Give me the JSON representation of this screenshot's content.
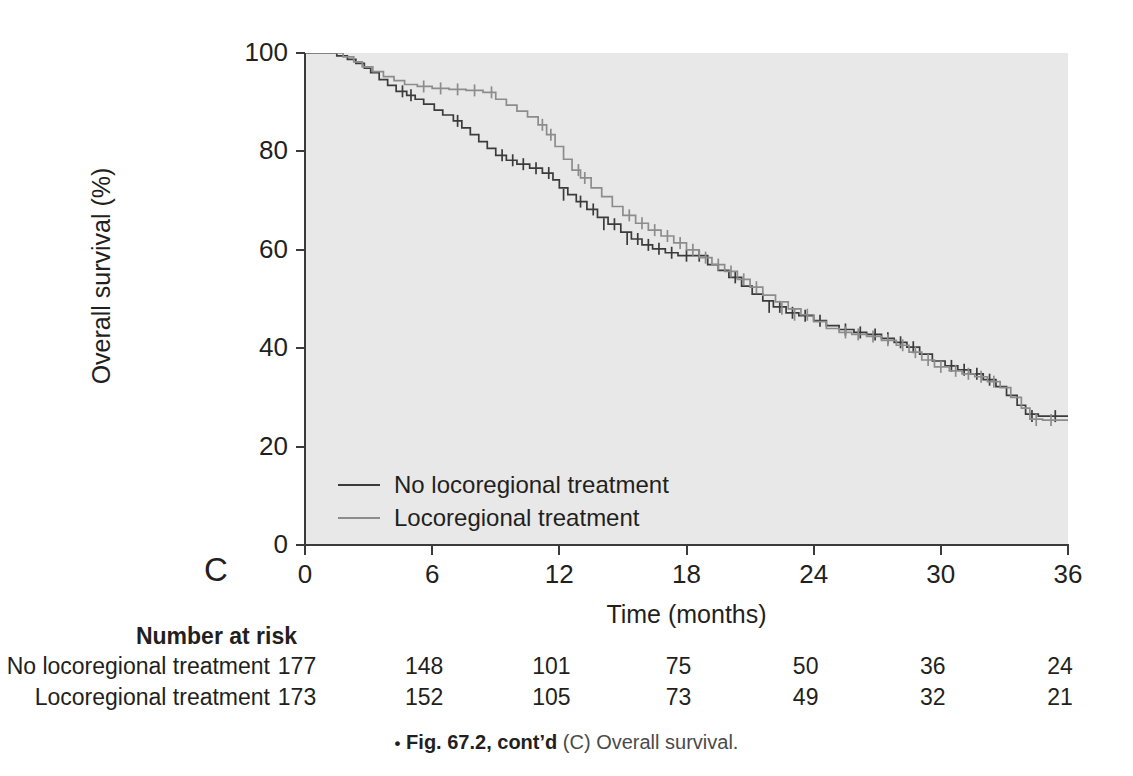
{
  "panel": {
    "letter": "C"
  },
  "axes": {
    "y_title": "Overall survival (%)",
    "x_title": "Time (months)",
    "y_ticks": [
      "100",
      "80",
      "60",
      "40",
      "20",
      "0"
    ],
    "x_ticks": [
      "0",
      "6",
      "12",
      "18",
      "24",
      "30",
      "36"
    ]
  },
  "legend": {
    "items": [
      {
        "label": "No locoregional treatment",
        "color": "#3b3b3b"
      },
      {
        "label": "Locoregional treatment",
        "color": "#8c8c8c"
      }
    ]
  },
  "risk_table": {
    "title": "Number at risk",
    "rows": [
      {
        "label": "No locoregional treatment",
        "values": [
          "177",
          "148",
          "101",
          "75",
          "50",
          "36",
          "24"
        ]
      },
      {
        "label": "Locoregional treatment",
        "values": [
          "173",
          "152",
          "105",
          "73",
          "49",
          "32",
          "21"
        ]
      }
    ]
  },
  "caption": {
    "bullet": "•",
    "bold": "Fig. 67.2, cont’d",
    "rest": "(C) Overall survival."
  },
  "colors": {
    "plot_background": "#e8e8e8",
    "axis": "#3b3b3b",
    "series_no_treatment": "#3b3b3b",
    "series_treatment": "#8c8c8c",
    "page_background": "#ffffff",
    "text": "#231f20"
  },
  "chart_data": {
    "type": "line",
    "subtype": "kaplan-meier-step",
    "title": "",
    "xlabel": "Time (months)",
    "ylabel": "Overall survival (%)",
    "xlim": [
      0,
      36
    ],
    "ylim": [
      0,
      100
    ],
    "xticks": [
      0,
      6,
      12,
      18,
      24,
      30,
      36
    ],
    "yticks": [
      0,
      20,
      40,
      60,
      80,
      100
    ],
    "grid": false,
    "legend_position": "bottom-left-inside",
    "series": [
      {
        "name": "No locoregional treatment",
        "color": "#3b3b3b",
        "n_at_risk_start": 177,
        "points": [
          [
            0,
            100
          ],
          [
            1.1,
            100
          ],
          [
            1.5,
            99.4
          ],
          [
            2.0,
            98.7
          ],
          [
            2.4,
            97.9
          ],
          [
            2.8,
            96.9
          ],
          [
            3.1,
            96.0
          ],
          [
            3.5,
            94.6
          ],
          [
            3.9,
            93.4
          ],
          [
            4.3,
            92.2
          ],
          [
            4.8,
            91.4
          ],
          [
            5.2,
            90.6
          ],
          [
            5.6,
            89.6
          ],
          [
            6.1,
            88.4
          ],
          [
            6.5,
            87.4
          ],
          [
            7.0,
            86.2
          ],
          [
            7.4,
            84.8
          ],
          [
            7.8,
            83.4
          ],
          [
            8.2,
            82.0
          ],
          [
            8.6,
            80.6
          ],
          [
            9.0,
            79.2
          ],
          [
            9.5,
            78.2
          ],
          [
            10.0,
            77.4
          ],
          [
            10.6,
            76.6
          ],
          [
            11.2,
            75.6
          ],
          [
            11.7,
            74.2
          ],
          [
            12.0,
            72.6
          ],
          [
            12.4,
            71.2
          ],
          [
            12.8,
            69.8
          ],
          [
            13.3,
            68.2
          ],
          [
            13.8,
            66.6
          ],
          [
            14.3,
            65.2
          ],
          [
            14.9,
            63.6
          ],
          [
            15.4,
            62.2
          ],
          [
            15.9,
            61.0
          ],
          [
            16.4,
            60.2
          ],
          [
            17.0,
            59.4
          ],
          [
            17.6,
            58.8
          ],
          [
            18.3,
            58.8
          ],
          [
            19.0,
            57.0
          ],
          [
            19.5,
            55.8
          ],
          [
            20.0,
            54.4
          ],
          [
            20.6,
            52.6
          ],
          [
            21.1,
            51.0
          ],
          [
            21.6,
            49.6
          ],
          [
            22.1,
            48.4
          ],
          [
            22.7,
            47.2
          ],
          [
            23.3,
            46.6
          ],
          [
            24.0,
            45.6
          ],
          [
            24.6,
            44.6
          ],
          [
            25.2,
            43.8
          ],
          [
            25.9,
            43.2
          ],
          [
            26.5,
            42.8
          ],
          [
            27.2,
            42.0
          ],
          [
            27.8,
            41.2
          ],
          [
            28.4,
            40.2
          ],
          [
            29.0,
            38.8
          ],
          [
            29.6,
            37.4
          ],
          [
            30.2,
            36.4
          ],
          [
            30.8,
            35.6
          ],
          [
            31.4,
            34.8
          ],
          [
            32.0,
            33.6
          ],
          [
            32.6,
            32.2
          ],
          [
            33.1,
            30.4
          ],
          [
            33.6,
            28.4
          ],
          [
            34.0,
            26.6
          ],
          [
            34.6,
            26.2
          ],
          [
            36.0,
            26.2
          ]
        ]
      },
      {
        "name": "Locoregional treatment",
        "color": "#8c8c8c",
        "n_at_risk_start": 173,
        "points": [
          [
            0,
            100
          ],
          [
            1.3,
            100
          ],
          [
            1.8,
            99.2
          ],
          [
            2.3,
            98.2
          ],
          [
            2.7,
            97.2
          ],
          [
            3.2,
            96.2
          ],
          [
            3.7,
            95.2
          ],
          [
            4.2,
            94.4
          ],
          [
            4.7,
            93.6
          ],
          [
            5.3,
            93.2
          ],
          [
            6.0,
            92.8
          ],
          [
            6.8,
            92.6
          ],
          [
            7.6,
            92.4
          ],
          [
            8.4,
            92.0
          ],
          [
            9.0,
            90.6
          ],
          [
            9.5,
            89.4
          ],
          [
            10.0,
            88.2
          ],
          [
            10.5,
            87.0
          ],
          [
            11.0,
            85.4
          ],
          [
            11.4,
            83.4
          ],
          [
            11.8,
            81.0
          ],
          [
            12.2,
            78.4
          ],
          [
            12.6,
            76.2
          ],
          [
            13.0,
            74.6
          ],
          [
            13.5,
            72.6
          ],
          [
            14.0,
            70.8
          ],
          [
            14.5,
            68.8
          ],
          [
            15.0,
            67.0
          ],
          [
            15.6,
            65.4
          ],
          [
            16.2,
            64.0
          ],
          [
            16.8,
            62.8
          ],
          [
            17.4,
            61.4
          ],
          [
            18.0,
            60.0
          ],
          [
            18.6,
            58.4
          ],
          [
            19.2,
            57.0
          ],
          [
            19.8,
            55.6
          ],
          [
            20.4,
            54.0
          ],
          [
            21.0,
            52.4
          ],
          [
            21.6,
            50.8
          ],
          [
            22.2,
            49.4
          ],
          [
            22.8,
            48.0
          ],
          [
            23.4,
            46.8
          ],
          [
            24.0,
            45.4
          ],
          [
            24.6,
            44.0
          ],
          [
            25.2,
            43.2
          ],
          [
            25.8,
            42.8
          ],
          [
            26.5,
            42.4
          ],
          [
            27.2,
            41.6
          ],
          [
            27.9,
            40.6
          ],
          [
            28.5,
            39.2
          ],
          [
            29.1,
            37.6
          ],
          [
            29.7,
            36.2
          ],
          [
            30.4,
            35.4
          ],
          [
            31.0,
            34.8
          ],
          [
            31.6,
            34.2
          ],
          [
            32.2,
            33.2
          ],
          [
            32.8,
            32.0
          ],
          [
            33.3,
            30.0
          ],
          [
            33.8,
            27.8
          ],
          [
            34.2,
            25.6
          ],
          [
            34.8,
            25.4
          ],
          [
            36.0,
            25.4
          ]
        ]
      }
    ],
    "censor_marks": {
      "No locoregional treatment": [
        [
          4.6,
          92.2
        ],
        [
          5.0,
          91.4
        ],
        [
          7.2,
          86.2
        ],
        [
          9.3,
          79.2
        ],
        [
          9.8,
          78.2
        ],
        [
          10.3,
          77.4
        ],
        [
          10.9,
          76.6
        ],
        [
          11.5,
          75.6
        ],
        [
          12.2,
          71.2
        ],
        [
          13.0,
          69.8
        ],
        [
          13.6,
          68.2
        ],
        [
          14.1,
          65.2
        ],
        [
          14.6,
          65.2
        ],
        [
          15.2,
          62.2
        ],
        [
          15.7,
          62.2
        ],
        [
          16.2,
          61.0
        ],
        [
          16.7,
          60.2
        ],
        [
          17.3,
          59.4
        ],
        [
          18.0,
          58.8
        ],
        [
          18.6,
          58.8
        ],
        [
          20.3,
          54.4
        ],
        [
          21.9,
          48.4
        ],
        [
          22.4,
          48.4
        ],
        [
          23.0,
          47.2
        ],
        [
          23.6,
          46.6
        ],
        [
          24.3,
          45.6
        ],
        [
          25.5,
          43.8
        ],
        [
          26.2,
          43.2
        ],
        [
          26.9,
          42.8
        ],
        [
          27.5,
          42.0
        ],
        [
          28.1,
          41.2
        ],
        [
          28.7,
          40.2
        ],
        [
          30.5,
          36.4
        ],
        [
          31.1,
          35.6
        ],
        [
          31.7,
          34.8
        ],
        [
          32.3,
          33.6
        ],
        [
          34.3,
          26.2
        ],
        [
          35.4,
          26.2
        ]
      ],
      "Locoregional treatment": [
        [
          5.6,
          93.2
        ],
        [
          6.4,
          92.8
        ],
        [
          7.2,
          92.6
        ],
        [
          8.0,
          92.4
        ],
        [
          8.8,
          92.0
        ],
        [
          11.2,
          85.4
        ],
        [
          11.6,
          83.4
        ],
        [
          12.9,
          76.2
        ],
        [
          13.2,
          74.6
        ],
        [
          15.3,
          67.0
        ],
        [
          15.9,
          65.4
        ],
        [
          16.5,
          64.0
        ],
        [
          17.1,
          62.8
        ],
        [
          17.7,
          61.4
        ],
        [
          18.3,
          60.0
        ],
        [
          18.9,
          58.4
        ],
        [
          19.5,
          57.0
        ],
        [
          20.1,
          55.6
        ],
        [
          20.7,
          54.0
        ],
        [
          21.3,
          52.4
        ],
        [
          22.5,
          48.0
        ],
        [
          23.1,
          46.8
        ],
        [
          23.7,
          46.8
        ],
        [
          25.5,
          43.2
        ],
        [
          26.1,
          42.8
        ],
        [
          26.8,
          42.4
        ],
        [
          27.5,
          41.6
        ],
        [
          28.2,
          40.6
        ],
        [
          28.8,
          39.2
        ],
        [
          29.4,
          37.6
        ],
        [
          30.0,
          36.2
        ],
        [
          30.7,
          35.4
        ],
        [
          31.3,
          34.8
        ],
        [
          31.9,
          34.2
        ],
        [
          32.5,
          33.2
        ],
        [
          34.5,
          25.4
        ],
        [
          35.2,
          25.4
        ]
      ]
    }
  }
}
